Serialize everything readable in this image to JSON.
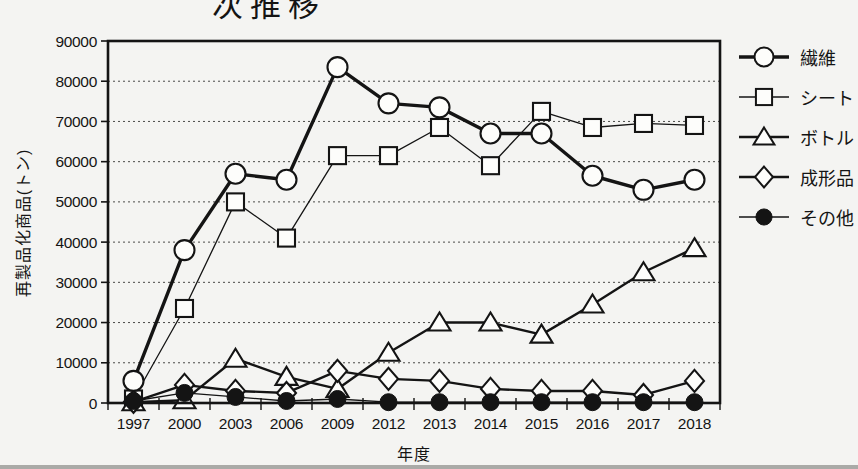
{
  "colors": {
    "ink": "#141414",
    "background": "#f4f4f2",
    "marker_fill": "#fdfdfb"
  },
  "chart_data": {
    "type": "line",
    "title": "次推移",
    "xlabel": "年度",
    "ylabel": "再製品化商品(トン)",
    "ylim": [
      0,
      90000
    ],
    "yticks": [
      0,
      10000,
      20000,
      30000,
      40000,
      50000,
      60000,
      70000,
      80000,
      90000
    ],
    "grid": "horizontal-dotted",
    "legend_position": "right",
    "categories": [
      "1997",
      "2000",
      "2003",
      "2006",
      "2009",
      "2012",
      "2013",
      "2014",
      "2015",
      "2016",
      "2017",
      "2018"
    ],
    "series": [
      {
        "name": "繊維",
        "marker": "circle",
        "fill": "open",
        "line_width": 3.4,
        "values": [
          5500,
          38000,
          57000,
          55500,
          83500,
          74500,
          73500,
          67000,
          67000,
          56500,
          53000,
          55500
        ]
      },
      {
        "name": "シート",
        "marker": "square",
        "fill": "open",
        "line_width": 1.3,
        "values": [
          1000,
          23500,
          50000,
          41000,
          61500,
          61500,
          68500,
          59000,
          72500,
          68500,
          69500,
          69000
        ]
      },
      {
        "name": "ボトル",
        "marker": "triangle",
        "fill": "open",
        "line_width": 2.4,
        "values": [
          200,
          700,
          11000,
          6500,
          3500,
          12500,
          20000,
          20000,
          17000,
          24500,
          32500,
          38500
        ]
      },
      {
        "name": "成形品",
        "marker": "diamond",
        "fill": "open",
        "line_width": 2.4,
        "values": [
          300,
          4500,
          3000,
          2500,
          8000,
          6000,
          5500,
          3500,
          3000,
          3000,
          2000,
          5500
        ]
      },
      {
        "name": "その他",
        "marker": "circle",
        "fill": "solid",
        "line_width": 1.3,
        "values": [
          500,
          2500,
          1500,
          500,
          1000,
          200,
          200,
          200,
          200,
          200,
          200,
          200
        ]
      }
    ]
  }
}
